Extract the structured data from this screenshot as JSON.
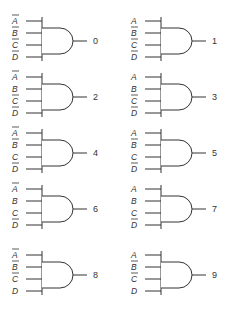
{
  "input_names": [
    "A",
    "B",
    "C",
    "D"
  ],
  "gates": [
    {
      "output": "0",
      "inputs": [
        {
          "name": "A",
          "inverted": true
        },
        {
          "name": "B",
          "inverted": true
        },
        {
          "name": "C",
          "inverted": true
        },
        {
          "name": "D",
          "inverted": true
        }
      ]
    },
    {
      "output": "1",
      "inputs": [
        {
          "name": "A",
          "inverted": false
        },
        {
          "name": "B",
          "inverted": true
        },
        {
          "name": "C",
          "inverted": true
        },
        {
          "name": "D",
          "inverted": true
        }
      ]
    },
    {
      "output": "2",
      "inputs": [
        {
          "name": "A",
          "inverted": true
        },
        {
          "name": "B",
          "inverted": false
        },
        {
          "name": "C",
          "inverted": true
        },
        {
          "name": "D",
          "inverted": true
        }
      ]
    },
    {
      "output": "3",
      "inputs": [
        {
          "name": "A",
          "inverted": false
        },
        {
          "name": "B",
          "inverted": false
        },
        {
          "name": "C",
          "inverted": true
        },
        {
          "name": "D",
          "inverted": true
        }
      ]
    },
    {
      "output": "4",
      "inputs": [
        {
          "name": "A",
          "inverted": true
        },
        {
          "name": "B",
          "inverted": true
        },
        {
          "name": "C",
          "inverted": false
        },
        {
          "name": "D",
          "inverted": true
        }
      ]
    },
    {
      "output": "5",
      "inputs": [
        {
          "name": "A",
          "inverted": false
        },
        {
          "name": "B",
          "inverted": true
        },
        {
          "name": "C",
          "inverted": false
        },
        {
          "name": "D",
          "inverted": true
        }
      ]
    },
    {
      "output": "6",
      "inputs": [
        {
          "name": "A",
          "inverted": true
        },
        {
          "name": "B",
          "inverted": false
        },
        {
          "name": "C",
          "inverted": false
        },
        {
          "name": "D",
          "inverted": true
        }
      ]
    },
    {
      "output": "7",
      "inputs": [
        {
          "name": "A",
          "inverted": false
        },
        {
          "name": "B",
          "inverted": false
        },
        {
          "name": "C",
          "inverted": false
        },
        {
          "name": "D",
          "inverted": true
        }
      ]
    },
    {
      "output": "8",
      "inputs": [
        {
          "name": "A",
          "inverted": true
        },
        {
          "name": "B",
          "inverted": true
        },
        {
          "name": "C",
          "inverted": true
        },
        {
          "name": "D",
          "inverted": false
        }
      ]
    },
    {
      "output": "9",
      "inputs": [
        {
          "name": "A",
          "inverted": false
        },
        {
          "name": "B",
          "inverted": true
        },
        {
          "name": "C",
          "inverted": true
        },
        {
          "name": "D",
          "inverted": false
        }
      ]
    }
  ],
  "colors": {
    "line": "#333333",
    "background": "#ffffff"
  }
}
